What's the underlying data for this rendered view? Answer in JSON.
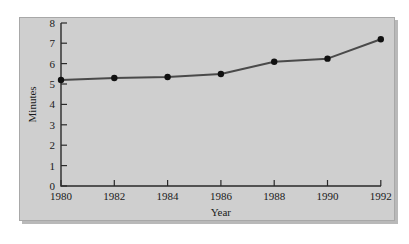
{
  "chart_data": {
    "type": "line",
    "title": "",
    "xlabel": "Year",
    "ylabel": "Minutes",
    "x": [
      1980,
      1982,
      1984,
      1986,
      1988,
      1990,
      1992
    ],
    "values": [
      5.2,
      5.3,
      5.35,
      5.5,
      6.1,
      6.25,
      7.2
    ],
    "series": [
      {
        "name": "Minutes",
        "values": [
          5.2,
          5.3,
          5.35,
          5.5,
          6.1,
          6.25,
          7.2
        ]
      }
    ],
    "xtick_labels": [
      "1980",
      "1982",
      "1984",
      "1986",
      "1988",
      "1990",
      "1992"
    ],
    "ytick_labels": [
      "0",
      "1",
      "2",
      "3",
      "4",
      "5",
      "6",
      "7",
      "8"
    ],
    "xlim": [
      1980,
      1992
    ],
    "ylim": [
      0,
      8
    ],
    "grid": false,
    "legend": "none",
    "marker": "filled-circle",
    "line_color": "#4a4a4a",
    "marker_color": "#111111",
    "axis_color": "#2a2a2a",
    "panel_background": "#cfcfcf",
    "page_background": "#ffffff"
  }
}
